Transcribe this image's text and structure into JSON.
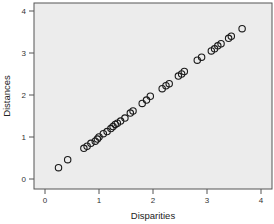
{
  "chart_data": {
    "type": "scatter",
    "title": "",
    "xlabel": "Disparities",
    "ylabel": "Distances",
    "xlim": [
      -0.2,
      4.2
    ],
    "ylim": [
      -0.2,
      4.2
    ],
    "x_ticks": [
      0,
      1,
      2,
      3,
      4
    ],
    "y_ticks": [
      0,
      1,
      2,
      3,
      4
    ],
    "grid": false,
    "legend": null,
    "marker": "open-circle",
    "colors": {
      "plot_background": "#ececec",
      "marker_stroke": "#1a1a1a",
      "axis": "#555555"
    },
    "points": [
      {
        "x": 0.25,
        "y": 0.27
      },
      {
        "x": 0.42,
        "y": 0.46
      },
      {
        "x": 0.72,
        "y": 0.73
      },
      {
        "x": 0.78,
        "y": 0.78
      },
      {
        "x": 0.85,
        "y": 0.85
      },
      {
        "x": 0.93,
        "y": 0.9
      },
      {
        "x": 0.97,
        "y": 0.95
      },
      {
        "x": 1.0,
        "y": 1.0
      },
      {
        "x": 1.08,
        "y": 1.08
      },
      {
        "x": 1.15,
        "y": 1.13
      },
      {
        "x": 1.22,
        "y": 1.2
      },
      {
        "x": 1.26,
        "y": 1.25
      },
      {
        "x": 1.3,
        "y": 1.3
      },
      {
        "x": 1.34,
        "y": 1.33
      },
      {
        "x": 1.4,
        "y": 1.38
      },
      {
        "x": 1.48,
        "y": 1.45
      },
      {
        "x": 1.58,
        "y": 1.57
      },
      {
        "x": 1.63,
        "y": 1.62
      },
      {
        "x": 1.8,
        "y": 1.8
      },
      {
        "x": 1.88,
        "y": 1.88
      },
      {
        "x": 1.95,
        "y": 1.97
      },
      {
        "x": 2.17,
        "y": 2.15
      },
      {
        "x": 2.24,
        "y": 2.22
      },
      {
        "x": 2.3,
        "y": 2.27
      },
      {
        "x": 2.47,
        "y": 2.45
      },
      {
        "x": 2.53,
        "y": 2.5
      },
      {
        "x": 2.58,
        "y": 2.56
      },
      {
        "x": 2.82,
        "y": 2.83
      },
      {
        "x": 2.9,
        "y": 2.9
      },
      {
        "x": 3.08,
        "y": 3.05
      },
      {
        "x": 3.14,
        "y": 3.1
      },
      {
        "x": 3.2,
        "y": 3.17
      },
      {
        "x": 3.26,
        "y": 3.22
      },
      {
        "x": 3.4,
        "y": 3.35
      },
      {
        "x": 3.45,
        "y": 3.4
      },
      {
        "x": 3.65,
        "y": 3.58
      }
    ]
  }
}
